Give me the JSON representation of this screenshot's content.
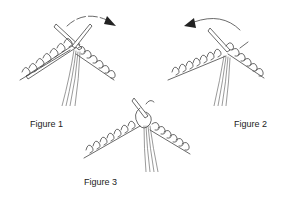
{
  "diagram": {
    "figures": [
      {
        "id": "figure-1",
        "label": "Figure 1",
        "arrow": "clockwise, pointing right-down"
      },
      {
        "id": "figure-2",
        "label": "Figure 2",
        "arrow": "counter-clockwise, pointing left"
      },
      {
        "id": "figure-3",
        "label": "Figure 3",
        "arrow": ""
      }
    ],
    "colors": {
      "line": "#444444",
      "background": "#ffffff",
      "label": "#222222"
    }
  }
}
